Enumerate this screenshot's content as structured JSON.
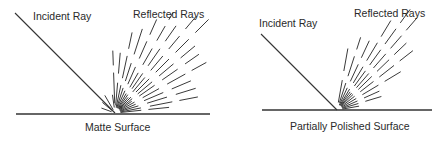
{
  "diagrams": [
    {
      "id": "matte",
      "incident_label": "Incident Ray",
      "reflected_label": "Reflected Rays",
      "surface_label": "Matte Surface",
      "origin": [
        115,
        113
      ],
      "incident_start": [
        15,
        13
      ],
      "surface": [
        16,
        210,
        114
      ],
      "label_pos": {
        "incident": [
          33,
          20
        ],
        "reflected": [
          133,
          18
        ],
        "surface": [
          85,
          131
        ]
      },
      "rays": [
        {
          "angle": 98,
          "dashes": [
            [
              6,
              18
            ]
          ]
        },
        {
          "angle": 92,
          "dashes": [
            [
              10,
              40
            ],
            [
              48,
              62
            ]
          ]
        },
        {
          "angle": 85,
          "dashes": [
            [
              8,
              30
            ],
            [
              40,
              60
            ]
          ]
        },
        {
          "angle": 78,
          "dashes": [
            [
              6,
              28
            ],
            [
              36,
              58
            ],
            [
              66,
              82
            ]
          ]
        },
        {
          "angle": 72,
          "dashes": [
            [
              6,
              26
            ],
            [
              34,
              52
            ],
            [
              62,
              88
            ]
          ]
        },
        {
          "angle": 66,
          "dashes": [
            [
              6,
              24
            ],
            [
              32,
              50
            ],
            [
              60,
              78
            ],
            [
              86,
              102
            ]
          ]
        },
        {
          "angle": 60,
          "dashes": [
            [
              6,
              22
            ],
            [
              30,
              46
            ],
            [
              56,
              74
            ],
            [
              84,
              100
            ],
            [
              108,
              116
            ]
          ]
        },
        {
          "angle": 55,
          "dashes": [
            [
              6,
              22
            ],
            [
              30,
              48
            ],
            [
              58,
              78
            ],
            [
              88,
              106
            ]
          ]
        },
        {
          "angle": 50,
          "dashes": [
            [
              6,
              20
            ],
            [
              28,
              46
            ],
            [
              56,
              74
            ],
            [
              84,
              100
            ],
            [
              110,
              126
            ]
          ]
        },
        {
          "angle": 45,
          "dashes": [
            [
              6,
              22
            ],
            [
              30,
              48
            ],
            [
              58,
              76
            ],
            [
              86,
              104
            ],
            [
              114,
              132
            ]
          ]
        },
        {
          "angle": 40,
          "dashes": [
            [
              6,
              22
            ],
            [
              30,
              48
            ],
            [
              58,
              76
            ],
            [
              86,
              104
            ]
          ]
        },
        {
          "angle": 35,
          "dashes": [
            [
              6,
              20
            ],
            [
              30,
              48
            ],
            [
              58,
              76
            ],
            [
              86,
              102
            ]
          ]
        },
        {
          "angle": 29,
          "dashes": [
            [
              6,
              22
            ],
            [
              32,
              50
            ],
            [
              60,
              80
            ],
            [
              88,
              104
            ]
          ]
        },
        {
          "angle": 23,
          "dashes": [
            [
              6,
              22
            ],
            [
              32,
              52
            ],
            [
              62,
              82
            ]
          ]
        },
        {
          "angle": 17,
          "dashes": [
            [
              6,
              24
            ],
            [
              34,
              54
            ],
            [
              64,
              84
            ]
          ]
        },
        {
          "angle": 11,
          "dashes": [
            [
              6,
              26
            ],
            [
              36,
              58
            ],
            [
              66,
              84
            ]
          ]
        },
        {
          "angle": 6,
          "dashes": [
            [
              6,
              26
            ],
            [
              34,
              54
            ]
          ]
        },
        {
          "angle": 140,
          "dashes": [
            [
              4,
              16
            ]
          ]
        },
        {
          "angle": 160,
          "dashes": [
            [
              4,
              14
            ]
          ]
        },
        {
          "angle": 120,
          "dashes": [
            [
              4,
              20
            ]
          ]
        }
      ]
    },
    {
      "id": "polished",
      "incident_label": "Incident Ray",
      "reflected_label": "Reflected Rays",
      "surface_label": "Partially Polished Surface",
      "origin": [
        337,
        110
      ],
      "incident_start": [
        261,
        34
      ],
      "surface": [
        262,
        432,
        110
      ],
      "label_pos": {
        "incident": [
          259,
          27
        ],
        "reflected": [
          354,
          17
        ],
        "surface": [
          290,
          130
        ]
      },
      "rays": [
        {
          "angle": 80,
          "dashes": [
            [
              8,
              30
            ],
            [
              40,
              62
            ]
          ]
        },
        {
          "angle": 72,
          "dashes": [
            [
              8,
              28
            ],
            [
              36,
              56
            ],
            [
              64,
              76
            ]
          ]
        },
        {
          "angle": 65,
          "dashes": [
            [
              6,
              24
            ],
            [
              32,
              50
            ],
            [
              58,
              76
            ]
          ]
        },
        {
          "angle": 59,
          "dashes": [
            [
              6,
              24
            ],
            [
              32,
              50
            ],
            [
              58,
              78
            ],
            [
              86,
              104
            ]
          ]
        },
        {
          "angle": 54,
          "dashes": [
            [
              6,
              22
            ],
            [
              30,
              48
            ],
            [
              56,
              74
            ],
            [
              82,
              100
            ],
            [
              108,
              124
            ]
          ]
        },
        {
          "angle": 49,
          "dashes": [
            [
              6,
              22
            ],
            [
              30,
              48
            ],
            [
              56,
              74
            ],
            [
              82,
              98
            ],
            [
              106,
              122
            ]
          ]
        },
        {
          "angle": 44,
          "dashes": [
            [
              6,
              22
            ],
            [
              30,
              48
            ],
            [
              56,
              72
            ],
            [
              80,
              96
            ]
          ]
        },
        {
          "angle": 38,
          "dashes": [
            [
              6,
              22
            ],
            [
              30,
              46
            ],
            [
              54,
              72
            ],
            [
              80,
              96
            ]
          ]
        },
        {
          "angle": 31,
          "dashes": [
            [
              6,
              22
            ],
            [
              30,
              48
            ],
            [
              56,
              74
            ]
          ]
        },
        {
          "angle": 24,
          "dashes": [
            [
              6,
              22
            ],
            [
              30,
              46
            ]
          ]
        },
        {
          "angle": 17,
          "dashes": [
            [
              6,
              22
            ],
            [
              30,
              46
            ]
          ]
        },
        {
          "angle": 10,
          "dashes": [
            [
              6,
              22
            ]
          ]
        }
      ]
    }
  ]
}
